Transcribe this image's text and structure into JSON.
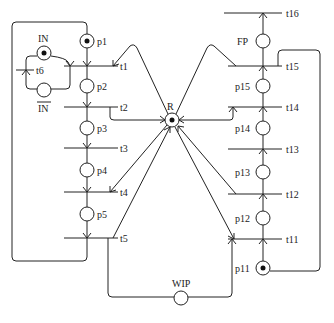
{
  "diagram": {
    "type": "petri-net",
    "colors": {
      "stroke": "#222222",
      "background": "#ffffff",
      "token": "#111111"
    },
    "places": [
      {
        "id": "p1",
        "label": "p1",
        "tokens": 1
      },
      {
        "id": "p2",
        "label": "p2",
        "tokens": 0
      },
      {
        "id": "p3",
        "label": "p3",
        "tokens": 0
      },
      {
        "id": "p4",
        "label": "p4",
        "tokens": 0
      },
      {
        "id": "p5",
        "label": "p5",
        "tokens": 0
      },
      {
        "id": "IN",
        "label": "IN",
        "tokens": 1
      },
      {
        "id": "IN_bar",
        "label": "IN",
        "overline": true,
        "tokens": 0
      },
      {
        "id": "R",
        "label": "R",
        "tokens": 1
      },
      {
        "id": "WIP",
        "label": "WIP",
        "tokens": 0
      },
      {
        "id": "p11",
        "label": "p11",
        "tokens": 1
      },
      {
        "id": "p12",
        "label": "p12",
        "tokens": 0
      },
      {
        "id": "p13",
        "label": "p13",
        "tokens": 0
      },
      {
        "id": "p14",
        "label": "p14",
        "tokens": 0
      },
      {
        "id": "p15",
        "label": "p15",
        "tokens": 0
      },
      {
        "id": "FP",
        "label": "FP",
        "tokens": 0
      }
    ],
    "transitions": [
      {
        "id": "t1",
        "label": "t1"
      },
      {
        "id": "t2",
        "label": "t2"
      },
      {
        "id": "t3",
        "label": "t3"
      },
      {
        "id": "t4",
        "label": "t4"
      },
      {
        "id": "t5",
        "label": "t5"
      },
      {
        "id": "t6",
        "label": "t6"
      },
      {
        "id": "t11",
        "label": "t11"
      },
      {
        "id": "t12",
        "label": "t12"
      },
      {
        "id": "t13",
        "label": "t13"
      },
      {
        "id": "t14",
        "label": "t14"
      },
      {
        "id": "t15",
        "label": "t15"
      },
      {
        "id": "t16",
        "label": "t16"
      }
    ]
  }
}
